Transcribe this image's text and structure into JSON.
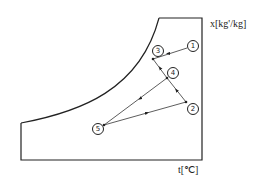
{
  "diagram": {
    "type": "psychrometric-chart",
    "y_axis_label": "x[kg'/kg]",
    "x_axis_label": "t[℃]",
    "colors": {
      "line": "#222222",
      "background": "#ffffff"
    },
    "points": [
      {
        "id": "1",
        "label": "1",
        "x": 187,
        "y": 48
      },
      {
        "id": "2",
        "label": "2",
        "x": 186,
        "y": 102
      },
      {
        "id": "3",
        "label": "3",
        "x": 153,
        "y": 59
      },
      {
        "id": "4",
        "label": "4",
        "x": 167,
        "y": 78
      },
      {
        "id": "5",
        "label": "5",
        "x": 104,
        "y": 125
      }
    ],
    "processes": [
      {
        "from": "1",
        "to": "3"
      },
      {
        "from": "4",
        "to": "3"
      },
      {
        "from": "2",
        "to": "4"
      },
      {
        "from": "4",
        "to": "5"
      },
      {
        "from": "5",
        "to": "2"
      }
    ]
  }
}
